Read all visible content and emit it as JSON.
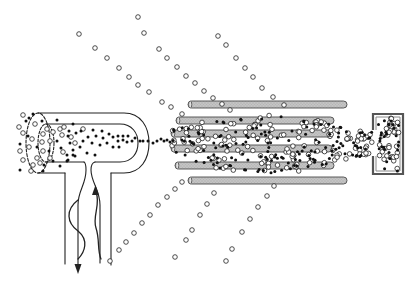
{
  "diagram": {
    "canvas": {
      "width": 418,
      "height": 282,
      "background": "#ffffff"
    },
    "colors": {
      "line": "#222222",
      "rod_fill": "#c4c4c4",
      "rod_stroke": "#4a4a4a",
      "ion_fill": "#111111",
      "neutral_fill": "#ffffff",
      "neutral_stroke": "#222222"
    },
    "ion_source": {
      "outer_ellipse": {
        "cx": 38,
        "cy": 143,
        "rx": 12,
        "ry": 30,
        "dash": "3,1.6"
      },
      "inner_ellipse": {
        "cx": 46,
        "cy": 143,
        "rx": 8,
        "ry": 19,
        "dash": "2.5,1.6"
      },
      "outer_tube": "M38,113 H124 C141,113 149,127 149,143 C149,159 141,173 124,173 H111 M65,173 H38",
      "inner_tube": "M46,124 H120 C132,124 138,133 138,143 C138,153 132,162 120,162 H95 M84,162 H46",
      "outer_stem": "M65,173 V264 M111,173 V265",
      "inner_stem_left": "M84,162 Q86,163 86,170 C86,185 78,190 78,205 V266",
      "inner_stem_right": "M95,162 Q91,163 91,170 C91,182 100,190 100,205 V263",
      "arrow_down": "74.5,264 81.5,264 78,274",
      "arrow_up": "92,195 99,195 95.5,185",
      "wave_left": "M78,200 C65,210 67,223 78,231 C89,240 85,252 78,259",
      "wave_right": "M96,192 C101,205 92,216 96,228 C100,240 97,250 101,259"
    },
    "rods": [
      {
        "x1": 188,
        "x2": 347,
        "y": 101,
        "h": 7
      },
      {
        "x1": 176,
        "x2": 334,
        "y": 117,
        "h": 7
      },
      {
        "x1": 171,
        "x2": 332,
        "y": 130,
        "h": 7
      },
      {
        "x1": 171,
        "x2": 332,
        "y": 145,
        "h": 7
      },
      {
        "x1": 175,
        "x2": 334,
        "y": 162,
        "h": 7
      },
      {
        "x1": 188,
        "x2": 347,
        "y": 177,
        "h": 7
      }
    ],
    "detector": {
      "outer": "M373,130 V114 H403 V174 H373 V156",
      "inner": "M376,130 V117 H400 V171 H376 V156"
    },
    "neutral_trajectories": [
      {
        "name": "upper-trajectory-1",
        "points": [
          [
            79,
            34
          ],
          [
            95,
            48
          ],
          [
            107,
            58
          ],
          [
            119,
            68
          ],
          [
            129,
            77
          ],
          [
            138,
            85
          ],
          [
            149,
            92
          ],
          [
            162,
            102
          ],
          [
            171,
            107
          ],
          [
            182,
            114
          ]
        ]
      },
      {
        "name": "upper-trajectory-2",
        "points": [
          [
            138,
            17
          ],
          [
            144,
            33
          ],
          [
            159,
            49
          ],
          [
            167,
            58
          ],
          [
            177,
            67
          ],
          [
            186,
            76
          ],
          [
            195,
            83
          ],
          [
            204,
            91
          ],
          [
            213,
            98
          ],
          [
            222,
            104
          ],
          [
            230,
            110
          ]
        ]
      },
      {
        "name": "upper-trajectory-3",
        "points": [
          [
            218,
            36
          ],
          [
            226,
            45
          ],
          [
            236,
            58
          ],
          [
            245,
            68
          ],
          [
            253,
            77
          ],
          [
            262,
            88
          ],
          [
            273,
            97
          ],
          [
            284,
            105
          ]
        ]
      },
      {
        "name": "lower-trajectory-1",
        "points": [
          [
            110,
            261
          ],
          [
            119,
            250
          ],
          [
            126,
            242
          ],
          [
            134,
            233
          ],
          [
            142,
            223
          ],
          [
            150,
            215
          ],
          [
            158,
            205
          ],
          [
            167,
            197
          ],
          [
            175,
            189
          ],
          [
            182,
            182
          ]
        ]
      },
      {
        "name": "lower-trajectory-2",
        "points": [
          [
            175,
            257
          ],
          [
            186,
            240
          ],
          [
            192,
            230
          ],
          [
            200,
            215
          ],
          [
            207,
            204
          ],
          [
            214,
            193
          ]
        ]
      },
      {
        "name": "lower-trajectory-3",
        "points": [
          [
            226,
            261
          ],
          [
            232,
            249
          ],
          [
            242,
            232
          ],
          [
            250,
            219
          ],
          [
            258,
            207
          ],
          [
            267,
            196
          ],
          [
            274,
            186
          ]
        ]
      }
    ],
    "source_particles": {
      "ions": [
        [
          33,
          114
        ],
        [
          26,
          121
        ],
        [
          29,
          118
        ],
        [
          42,
          121
        ],
        [
          57,
          120
        ],
        [
          20,
          144
        ],
        [
          37,
          147
        ],
        [
          49,
          151
        ],
        [
          57,
          141
        ],
        [
          61,
          148
        ],
        [
          68,
          136
        ],
        [
          70,
          143
        ],
        [
          73,
          155
        ],
        [
          67,
          161
        ],
        [
          60,
          166
        ],
        [
          20,
          170
        ],
        [
          44,
          165
        ],
        [
          53,
          161
        ],
        [
          69,
          131
        ],
        [
          43,
          171
        ],
        [
          28,
          136
        ],
        [
          73,
          124
        ],
        [
          81,
          131
        ],
        [
          76,
          133
        ],
        [
          93,
          130
        ],
        [
          102,
          131
        ],
        [
          109,
          134
        ],
        [
          113,
          137
        ],
        [
          88,
          137
        ],
        [
          96,
          136
        ],
        [
          103,
          138
        ],
        [
          83,
          141
        ],
        [
          92,
          143
        ],
        [
          100,
          145
        ],
        [
          107,
          143
        ],
        [
          118,
          141
        ],
        [
          123,
          140
        ],
        [
          127,
          142
        ],
        [
          132,
          141
        ],
        [
          135,
          138
        ],
        [
          140,
          141
        ],
        [
          119,
          147
        ],
        [
          113,
          147
        ],
        [
          80,
          147
        ],
        [
          73,
          150
        ],
        [
          87,
          153
        ],
        [
          95,
          155
        ],
        [
          75,
          156
        ],
        [
          68,
          160
        ],
        [
          67,
          155
        ],
        [
          123,
          136
        ],
        [
          128,
          136
        ],
        [
          118,
          136
        ]
      ],
      "neutrals": [
        [
          23,
          115
        ],
        [
          19,
          127
        ],
        [
          35,
          124
        ],
        [
          23,
          133
        ],
        [
          32,
          139
        ],
        [
          43,
          134
        ],
        [
          47,
          129
        ],
        [
          53,
          132
        ],
        [
          42,
          142
        ],
        [
          20,
          151
        ],
        [
          29,
          147
        ],
        [
          50,
          141
        ],
        [
          23,
          160
        ],
        [
          37,
          158
        ],
        [
          43,
          151
        ],
        [
          50,
          158
        ],
        [
          33,
          165
        ],
        [
          40,
          163
        ],
        [
          31,
          171
        ],
        [
          60,
          129
        ],
        [
          64,
          127
        ],
        [
          83,
          129
        ],
        [
          62,
          135
        ],
        [
          75,
          143
        ],
        [
          63,
          152
        ],
        [
          71,
          137
        ]
      ]
    },
    "beam_ions": [
      [
        143,
        141
      ],
      [
        148,
        141
      ],
      [
        153,
        143
      ],
      [
        157,
        141
      ],
      [
        161,
        139
      ],
      [
        164,
        141
      ],
      [
        167,
        140
      ],
      [
        170,
        142
      ]
    ],
    "beam_cloud": {
      "seed": 7,
      "ion_radius": 1.5,
      "neutral_radius": 2.3,
      "regions": [
        {
          "name": "rod-region",
          "count": 250,
          "open_ratio": 0.5,
          "profile": [
            [
              172,
              141,
              11
            ],
            [
              210,
              143,
              24
            ],
            [
              250,
              144,
              30
            ],
            [
              300,
              145,
              28
            ],
            [
              345,
              143,
              17
            ]
          ]
        },
        {
          "name": "funnel",
          "count": 45,
          "open_ratio": 0.6,
          "profile": [
            [
              345,
              143,
              17
            ],
            [
              372,
              143,
              12
            ]
          ]
        },
        {
          "name": "detector-interior",
          "count": 60,
          "open_ratio": 0.55,
          "rect": [
            378,
            118,
            399,
            171
          ]
        }
      ]
    }
  }
}
